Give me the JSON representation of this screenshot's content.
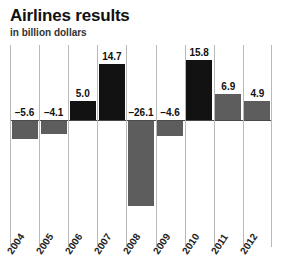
{
  "chart_data": {
    "type": "bar",
    "title": "Airlines results",
    "subtitle": "in billion dollars",
    "xlabel": "",
    "ylabel": "in billion dollars",
    "categories": [
      "2004",
      "2005",
      "2006",
      "2007",
      "2008",
      "2009",
      "2010",
      "2011",
      "2012"
    ],
    "values": [
      -5.6,
      -4.1,
      5.0,
      14.7,
      -26.1,
      -4.6,
      15.8,
      6.9,
      4.9
    ],
    "labels": [
      "–5.6",
      "–4.1",
      "5.0",
      "14.7",
      "–26.1",
      "–4.6",
      "15.8",
      "6.9",
      "4.9"
    ],
    "bar_styles": [
      "grey",
      "grey",
      "black",
      "black",
      "grey",
      "grey",
      "black",
      "grey",
      "grey"
    ],
    "ylim": [
      -26.1,
      15.8
    ],
    "grid": "vertical-only",
    "legend": "none",
    "colors": {
      "positive_bar": "#121212",
      "secondary_bar": "#5d5d5d",
      "gridline": "#b9b9b9",
      "zeroline": "#4a4a4a",
      "background": "#ffffff",
      "text": "#111111"
    }
  }
}
